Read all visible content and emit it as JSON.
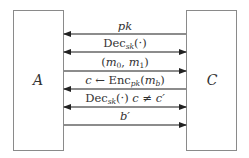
{
  "diagram": {
    "parties": {
      "left": {
        "label": "A"
      },
      "right": {
        "label": "C"
      }
    },
    "messages": [
      {
        "label": "pk",
        "direction": "left"
      },
      {
        "label": "Dec_sk(·)",
        "direction": "both"
      },
      {
        "label": "(m_0, m_1)",
        "direction": "right"
      },
      {
        "label": "c ← Enc_pk(m_b)",
        "direction": "left"
      },
      {
        "label": "Dec_sk(·) c ≠ c'",
        "direction": "both"
      },
      {
        "label": "b'",
        "direction": "right"
      }
    ],
    "parts": {
      "pk": "pk",
      "dec": "Dec",
      "sk": "sk",
      "dot_arg": "(·)",
      "lparen": "(",
      "m": "m",
      "zero": "0",
      "comma": ", ",
      "one": "1",
      "rparen": ")",
      "c": "c",
      "larrow": " ← ",
      "enc": "Enc",
      "b": "b",
      "neq_tail": " c ≠ c′",
      "bprime": "b′"
    },
    "colors": {
      "box_border": "#8a8a8a",
      "arrow_line": "#666666",
      "arrow_head": "#222222"
    }
  }
}
